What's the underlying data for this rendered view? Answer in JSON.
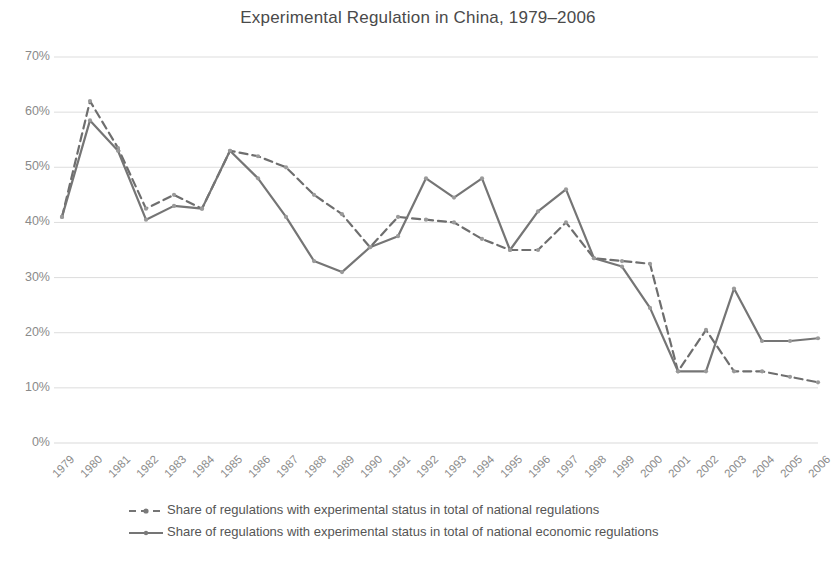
{
  "chart_data": {
    "type": "line",
    "title": "Experimental Regulation in China, 1979–2006",
    "xlabel": "",
    "ylabel": "",
    "ylim": [
      0,
      70
    ],
    "ytick_labels": [
      "0%",
      "10%",
      "20%",
      "30%",
      "40%",
      "50%",
      "60%",
      "70%"
    ],
    "ytick_values": [
      0,
      10,
      20,
      30,
      40,
      50,
      60,
      70
    ],
    "grid": true,
    "legend_position": "bottom",
    "categories": [
      "1979",
      "1980",
      "1981",
      "1982",
      "1983",
      "1984",
      "1985",
      "1986",
      "1987",
      "1988",
      "1989",
      "1990",
      "1991",
      "1992",
      "1993",
      "1994",
      "1995",
      "1996",
      "1997",
      "1998",
      "1999",
      "2000",
      "2001",
      "2002",
      "2003",
      "2004",
      "2005",
      "2006"
    ],
    "series": [
      {
        "name": "Share of regulations with experimental status in total of national regulations",
        "style": "dashed",
        "color": "#6e6e6e",
        "values": [
          41,
          62,
          53.5,
          42.5,
          45,
          42.5,
          53,
          52,
          50,
          45,
          41.5,
          35.5,
          41,
          40.5,
          40,
          37,
          35,
          35,
          40,
          33.5,
          33,
          32.5,
          13,
          20.5,
          13,
          13,
          12,
          11
        ]
      },
      {
        "name": "Share of regulations with experimental status in total of national economic regulations",
        "style": "solid",
        "color": "#757575",
        "values": [
          41,
          58.5,
          53,
          40.5,
          43,
          42.5,
          53,
          48,
          41,
          33,
          31,
          35.5,
          37.5,
          48,
          44.5,
          48,
          35,
          42,
          46,
          33.5,
          32,
          24.5,
          13,
          13,
          28,
          18.5,
          18.5,
          19
        ]
      }
    ]
  },
  "legend": {
    "items": [
      {
        "label": "Share of regulations with experimental status in total of national regulations",
        "style": "dashed"
      },
      {
        "label": "Share of regulations with experimental status in total of national economic regulations",
        "style": "solid"
      }
    ]
  },
  "colors": {
    "line": "#757575",
    "grid": "#d9d9d9",
    "text": "#8a8a8a",
    "title": "#4a4a4a"
  }
}
